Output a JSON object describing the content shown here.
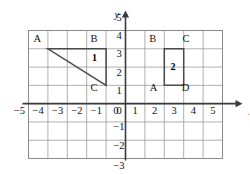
{
  "figure": {
    "title": "",
    "axis_labels": {
      "x": "x",
      "y": "y"
    },
    "x_ticks": [
      "-5",
      "-4",
      "-3",
      "-2",
      "-1",
      "0",
      "1",
      "2",
      "3",
      "4",
      "5"
    ],
    "y_ticks": [
      "5",
      "4",
      "3",
      "2",
      "1",
      "0",
      "-1",
      "-2",
      "-3"
    ],
    "origin_label": "0",
    "grid": {
      "visible": true,
      "x_min": -5,
      "x_max": 5,
      "y_min": -3,
      "y_max": 4
    },
    "colors": {
      "grid": "#9a9a9a",
      "axis": "#3a3a3a",
      "shape": "#4a4a4a",
      "text": "#111111",
      "background": "#ffffff"
    }
  },
  "chart_data": {
    "type": "scatter",
    "title": "",
    "xlabel": "x",
    "ylabel": "y",
    "xlim": [
      -5,
      5
    ],
    "ylim": [
      -3,
      4
    ],
    "grid": true,
    "legend": "none",
    "shapes": [
      {
        "id": "1",
        "name": "triangle-1",
        "kind": "triangle",
        "label": "1",
        "label_at": [
          -1.6,
          2.5
        ],
        "closed": true,
        "vertices": [
          {
            "label": "A",
            "x": -4,
            "y": 3,
            "label_offset": [
              -0.55,
              0.55
            ]
          },
          {
            "label": "B",
            "x": -1,
            "y": 3,
            "label_offset": [
              -0.62,
              0.55
            ]
          },
          {
            "label": "C",
            "x": -1,
            "y": 1,
            "label_offset": [
              -0.62,
              -0.12
            ]
          }
        ]
      },
      {
        "id": "2",
        "name": "rectangle-2",
        "kind": "rectangle",
        "label": "2",
        "label_at": [
          2.45,
          2.0
        ],
        "closed": true,
        "vertices": [
          {
            "label": "A",
            "x": 2,
            "y": 1,
            "label_offset": [
              -0.55,
              -0.12
            ]
          },
          {
            "label": "B",
            "x": 2,
            "y": 3,
            "label_offset": [
              -0.6,
              0.55
            ]
          },
          {
            "label": "C",
            "x": 3,
            "y": 3,
            "label_offset": [
              0.12,
              0.55
            ]
          },
          {
            "label": "D",
            "x": 3,
            "y": 1,
            "label_offset": [
              0.1,
              -0.12
            ]
          }
        ]
      }
    ]
  }
}
